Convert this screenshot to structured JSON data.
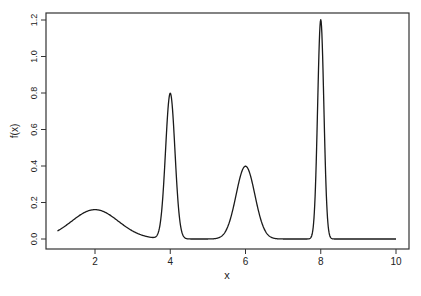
{
  "chart_data": {
    "type": "line",
    "title": "",
    "xlabel": "x",
    "ylabel": "f(x)",
    "xlim": [
      1,
      10
    ],
    "ylim": [
      0,
      1.2
    ],
    "x_ticks": [
      2,
      4,
      6,
      8,
      10
    ],
    "x_tick_labels": [
      "2",
      "4",
      "6",
      "8",
      "10"
    ],
    "y_ticks": [
      0.0,
      0.2,
      0.4,
      0.6,
      0.8,
      1.0,
      1.2
    ],
    "y_tick_labels": [
      "0.0",
      "0.2",
      "0.4",
      "0.6",
      "0.8",
      "1.0",
      "1.2"
    ],
    "grid": false,
    "legend": null,
    "components": [
      {
        "mean": 2,
        "weight": 0.25,
        "sd": 0.62,
        "peak": 0.16
      },
      {
        "mean": 4,
        "weight": 0.25,
        "sd": 0.125,
        "peak": 0.8
      },
      {
        "mean": 6,
        "weight": 0.25,
        "sd": 0.25,
        "peak": 0.4
      },
      {
        "mean": 8,
        "weight": 0.25,
        "sd": 0.083,
        "peak": 1.2
      }
    ],
    "series": [
      {
        "name": "f(x)",
        "x": [
          1.0,
          1.5,
          2.0,
          2.5,
          3.0,
          3.5,
          3.75,
          3.9,
          4.0,
          4.1,
          4.25,
          4.5,
          5.0,
          5.5,
          6.0,
          6.5,
          7.0,
          7.5,
          7.8,
          7.9,
          8.0,
          8.1,
          8.2,
          8.5,
          9.0,
          10.0
        ],
        "values": [
          0.04,
          0.11,
          0.16,
          0.12,
          0.05,
          0.01,
          0.1,
          0.58,
          0.8,
          0.58,
          0.11,
          0.0,
          0.0,
          0.05,
          0.4,
          0.05,
          0.0,
          0.0,
          0.07,
          0.58,
          1.2,
          0.58,
          0.07,
          0.0,
          0.0,
          0.0
        ]
      }
    ]
  },
  "plot": {
    "line_color": "#1a1a1a",
    "axis_color": "#333333"
  }
}
